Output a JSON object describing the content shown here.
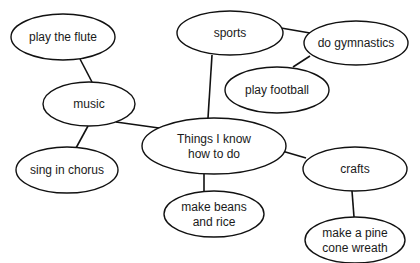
{
  "diagram": {
    "type": "mind-map",
    "center": {
      "id": "center",
      "lines": [
        "Things I know",
        "how to do"
      ]
    },
    "nodes": [
      {
        "id": "center",
        "lines": [
          "Things I know",
          "how to do"
        ],
        "cx": 214,
        "cy": 146,
        "rx": 72,
        "ry": 28
      },
      {
        "id": "music",
        "lines": [
          "music"
        ],
        "cx": 89,
        "cy": 104,
        "rx": 46,
        "ry": 22
      },
      {
        "id": "play-the-flute",
        "lines": [
          "play the flute"
        ],
        "cx": 63,
        "cy": 37,
        "rx": 52,
        "ry": 23
      },
      {
        "id": "sing-in-chorus",
        "lines": [
          "sing in chorus"
        ],
        "cx": 67,
        "cy": 170,
        "rx": 51,
        "ry": 23
      },
      {
        "id": "sports",
        "lines": [
          "sports"
        ],
        "cx": 230,
        "cy": 33,
        "rx": 53,
        "ry": 22
      },
      {
        "id": "do-gymnastics",
        "lines": [
          "do gymnastics"
        ],
        "cx": 356,
        "cy": 43,
        "rx": 52,
        "ry": 22
      },
      {
        "id": "play-football",
        "lines": [
          "play football"
        ],
        "cx": 277,
        "cy": 90,
        "rx": 52,
        "ry": 23
      },
      {
        "id": "crafts",
        "lines": [
          "crafts"
        ],
        "cx": 355,
        "cy": 169,
        "rx": 52,
        "ry": 22
      },
      {
        "id": "make-a-pine-cone-wreath",
        "lines": [
          "make a pine",
          "cone wreath"
        ],
        "cx": 355,
        "cy": 240,
        "rx": 50,
        "ry": 23
      },
      {
        "id": "make-beans-and-rice",
        "lines": [
          "make beans",
          "and rice"
        ],
        "cx": 214,
        "cy": 214,
        "rx": 50,
        "ry": 23
      }
    ],
    "edges": [
      {
        "from": "center",
        "to": "music",
        "x1": 159,
        "y1": 128,
        "x2": 116,
        "y2": 122
      },
      {
        "from": "music",
        "to": "play-the-flute",
        "x1": 92,
        "y1": 82,
        "x2": 80,
        "y2": 59
      },
      {
        "from": "music",
        "to": "sing-in-chorus",
        "x1": 88,
        "y1": 126,
        "x2": 76,
        "y2": 148
      },
      {
        "from": "center",
        "to": "sports",
        "x1": 208,
        "y1": 118,
        "x2": 212,
        "y2": 55
      },
      {
        "from": "sports",
        "to": "do-gymnastics",
        "x1": 281,
        "y1": 28,
        "x2": 310,
        "y2": 33
      },
      {
        "from": "do-gymnastics",
        "to": "play-football",
        "x1": 310,
        "y1": 56,
        "x2": 293,
        "y2": 67
      },
      {
        "from": "center",
        "to": "crafts",
        "x1": 282,
        "y1": 151,
        "x2": 306,
        "y2": 158
      },
      {
        "from": "crafts",
        "to": "make-a-pine-cone-wreath",
        "x1": 352,
        "y1": 191,
        "x2": 354,
        "y2": 217
      },
      {
        "from": "center",
        "to": "make-beans-and-rice",
        "x1": 204,
        "y1": 174,
        "x2": 204,
        "y2": 192
      }
    ]
  }
}
